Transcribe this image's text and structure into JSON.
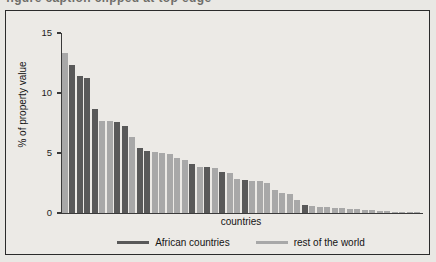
{
  "top_cut_text": "figure caption clipped at top edge",
  "chart_data": {
    "type": "bar",
    "title": "",
    "xlabel": "countries",
    "ylabel": "% of property value",
    "ylim": [
      0,
      15
    ],
    "yticks": [
      0,
      5,
      10,
      15
    ],
    "ytick_labels": [
      "0",
      "5",
      "10",
      "15"
    ],
    "grid": false,
    "legend_position": "bottom",
    "colors": {
      "african": "#595959",
      "rest": "#a8a8a8",
      "axis": "#3a3a3a",
      "frame": "#2b2b2b",
      "background": "#eceae6",
      "page_background": "#e9e8e4"
    },
    "legend": [
      {
        "label": "African countries",
        "color": "#595959",
        "group": "african"
      },
      {
        "label": "rest of the world",
        "color": "#a8a8a8",
        "group": "rest"
      }
    ],
    "categories": [
      "c1",
      "c2",
      "c3",
      "c4",
      "c5",
      "c6",
      "c7",
      "c8",
      "c9",
      "c10",
      "c11",
      "c12",
      "c13",
      "c14",
      "c15",
      "c16",
      "c17",
      "c18",
      "c19",
      "c20",
      "c21",
      "c22",
      "c23",
      "c24",
      "c25",
      "c26",
      "c27",
      "c28",
      "c29",
      "c30",
      "c31",
      "c32",
      "c33",
      "c34",
      "c35",
      "c36",
      "c37",
      "c38",
      "c39",
      "c40",
      "c41",
      "c42",
      "c43",
      "c44",
      "c45",
      "c46",
      "c47",
      "c48"
    ],
    "values": [
      13.3,
      12.3,
      11.4,
      11.25,
      8.65,
      7.7,
      7.65,
      7.6,
      7.25,
      6.3,
      5.45,
      5.15,
      5.1,
      5.0,
      4.9,
      4.6,
      4.4,
      4.05,
      3.85,
      3.85,
      3.75,
      3.4,
      3.35,
      2.85,
      2.75,
      2.7,
      2.65,
      2.5,
      1.9,
      1.7,
      1.55,
      1.1,
      0.7,
      0.55,
      0.5,
      0.5,
      0.45,
      0.4,
      0.35,
      0.3,
      0.28,
      0.22,
      0.18,
      0.15,
      0.12,
      0.1,
      0.08,
      0.06
    ],
    "groups": [
      "rest",
      "african",
      "african",
      "african",
      "african",
      "rest",
      "rest",
      "african",
      "african",
      "rest",
      "african",
      "african",
      "rest",
      "rest",
      "rest",
      "rest",
      "rest",
      "african",
      "rest",
      "african",
      "rest",
      "african",
      "rest",
      "rest",
      "african",
      "rest",
      "rest",
      "rest",
      "rest",
      "rest",
      "rest",
      "rest",
      "african",
      "rest",
      "rest",
      "rest",
      "rest",
      "rest",
      "rest",
      "rest",
      "rest",
      "rest",
      "rest",
      "rest",
      "rest",
      "rest",
      "rest",
      "rest"
    ]
  }
}
